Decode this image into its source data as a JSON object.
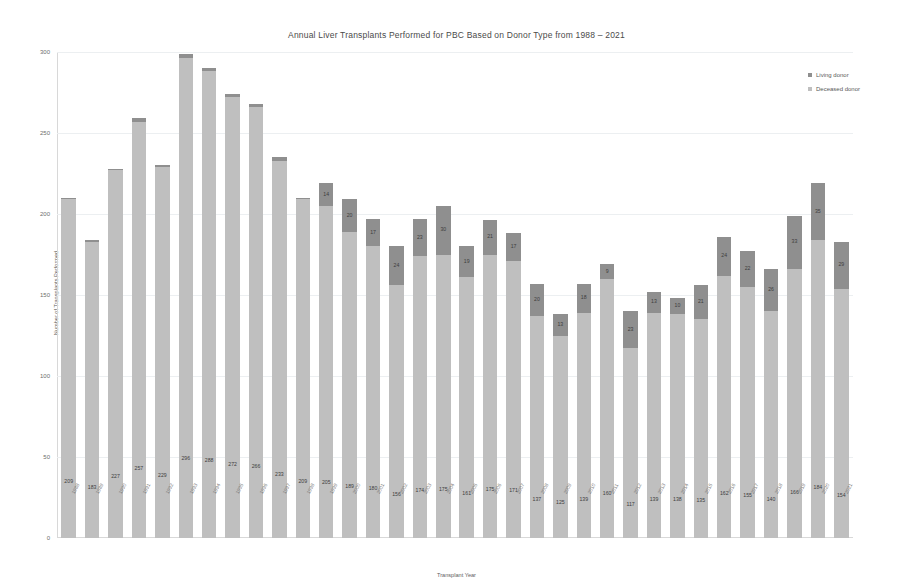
{
  "chart_data": {
    "type": "bar",
    "stacked": true,
    "title": "Annual Liver Transplants Performed for PBC Based on Donor Type from 1988 – 2021",
    "xlabel": "Transplant Year",
    "ylabel": "Number of Transplants Performed",
    "ylim": [
      0,
      300
    ],
    "yticks": [
      0,
      50,
      100,
      150,
      200,
      250,
      300
    ],
    "grid": true,
    "legend_position": "top-right",
    "categories": [
      "1988",
      "1989",
      "1990",
      "1991",
      "1992",
      "1993",
      "1994",
      "1995",
      "1996",
      "1997",
      "1998",
      "1999",
      "2000",
      "2001",
      "2002",
      "2003",
      "2004",
      "2005",
      "2006",
      "2007",
      "2008",
      "2009",
      "2010",
      "2011",
      "2012",
      "2013",
      "2014",
      "2015",
      "2016",
      "2017",
      "2018",
      "2019",
      "2020",
      "2021"
    ],
    "series": [
      {
        "name": "Deceased donor",
        "color": "#bfbfbf",
        "values": [
          209,
          183,
          227,
          257,
          229,
          296,
          288,
          272,
          266,
          233,
          209,
          205,
          189,
          180,
          156,
          174,
          175,
          161,
          175,
          171,
          137,
          125,
          139,
          160,
          117,
          139,
          138,
          135,
          162,
          155,
          140,
          166,
          184,
          154
        ]
      },
      {
        "name": "Living donor",
        "color": "#8f8f8f",
        "values": [
          1,
          1,
          1,
          2,
          1,
          3,
          2,
          2,
          2,
          2,
          1,
          14,
          20,
          17,
          24,
          23,
          30,
          19,
          21,
          17,
          20,
          13,
          18,
          9,
          23,
          13,
          10,
          21,
          24,
          22,
          26,
          33,
          35,
          29
        ]
      }
    ],
    "deceased_labels": [
      "209",
      "183",
      "227",
      "257",
      "229",
      "296",
      "288",
      "272",
      "266",
      "233",
      "209",
      "205",
      "189",
      "180",
      "156",
      "174",
      "175",
      "161",
      "175",
      "171",
      "137",
      "125",
      "139",
      "160",
      "117",
      "139",
      "138",
      "135",
      "162",
      "155",
      "140",
      "166",
      "184",
      "154"
    ],
    "living_labels": [
      "",
      "",
      "",
      "",
      "",
      "",
      "",
      "",
      "",
      "",
      "",
      "14",
      "20",
      "17",
      "24",
      "23",
      "30",
      "19",
      "21",
      "17",
      "20",
      "13",
      "18",
      "9",
      "23",
      "13",
      "10",
      "21",
      "24",
      "22",
      "26",
      "33",
      "35",
      "29"
    ]
  },
  "legend": {
    "items": [
      {
        "label": "Living donor",
        "color": "#8f8f8f"
      },
      {
        "label": "Deceased donor",
        "color": "#bfbfbf"
      }
    ]
  }
}
